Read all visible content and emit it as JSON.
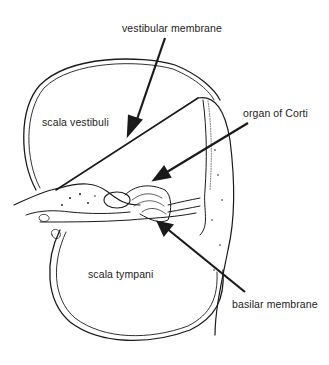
{
  "diagram": {
    "labels": {
      "vestibular_membrane": "vestibular membrane",
      "scala_vestibuli": "scala vestibuli",
      "organ_of_corti": "organ of Corti",
      "scala_tympani": "scala tympani",
      "basilar_membrane": "basilar membrane"
    },
    "colors": {
      "line": "#1a1a1a",
      "background": "#ffffff"
    }
  }
}
